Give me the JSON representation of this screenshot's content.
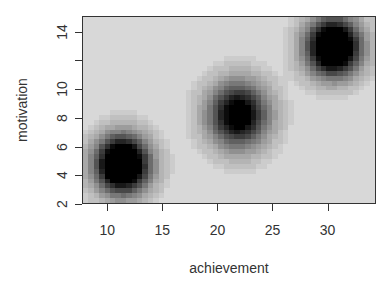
{
  "chart_data": {
    "type": "heatmap",
    "title": "",
    "xlabel": "achievement",
    "ylabel": "motivation",
    "xlim": [
      7.7,
      34.4
    ],
    "ylim": [
      2,
      15.1
    ],
    "x_ticks": [
      10,
      15,
      20,
      25,
      30
    ],
    "y_ticks": [
      2,
      4,
      6,
      8,
      10,
      12,
      14
    ],
    "y_tick_labels": [
      "2",
      "4",
      "6",
      "8",
      "10",
      "",
      "14"
    ],
    "grid": false,
    "legend": null,
    "colormap": "grayscale (light = low density, black = high density)",
    "background_color": "#d4d4d4",
    "clusters": [
      {
        "name": "cluster-1",
        "center_x": 11.3,
        "center_y": 4.7,
        "sd_x": 1.7,
        "sd_y": 1.4,
        "peak": 1.0
      },
      {
        "name": "cluster-2",
        "center_x": 21.9,
        "center_y": 8.2,
        "sd_x": 1.9,
        "sd_y": 1.6,
        "peak": 0.72
      },
      {
        "name": "cluster-3",
        "center_x": 30.6,
        "center_y": 13.0,
        "sd_x": 1.7,
        "sd_y": 1.4,
        "peak": 1.0
      }
    ]
  }
}
